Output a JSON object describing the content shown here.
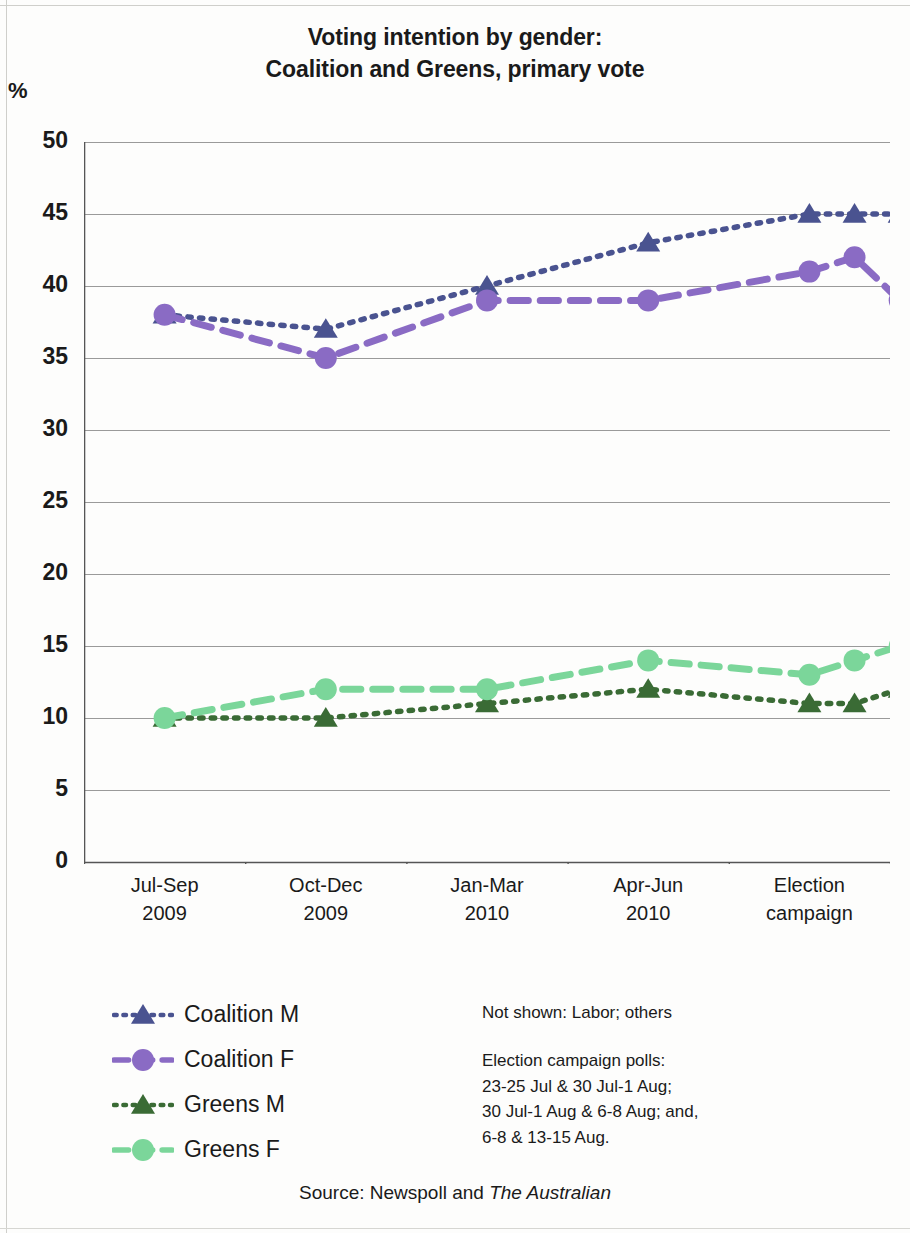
{
  "title": {
    "line1": "Voting intention by gender:",
    "line2": "Coalition and Greens, primary vote"
  },
  "axis_unit_label": "%",
  "legend": {
    "items": [
      {
        "label": "Coalition M",
        "color": "#4a5390",
        "marker": "triangle",
        "line": "dotted",
        "key_name": "legend-key-coalition-m"
      },
      {
        "label": "Coalition F",
        "color": "#8a6bc4",
        "marker": "circle",
        "line": "dashed",
        "key_name": "legend-key-coalition-f"
      },
      {
        "label": "Greens M",
        "color": "#3a6b35",
        "marker": "triangle",
        "line": "dotted",
        "key_name": "legend-key-greens-m"
      },
      {
        "label": "Greens F",
        "color": "#7bd69a",
        "marker": "circle",
        "line": "dashed",
        "key_name": "legend-key-greens-f"
      }
    ]
  },
  "notes": {
    "not_shown": "Not shown: Labor; others",
    "polls_heading": "Election campaign  polls:",
    "polls_line1": "23-25 Jul & 30 Jul-1 Aug;",
    "polls_line2": "30 Jul-1 Aug & 6-8 Aug; and,",
    "polls_line3": "6-8 & 13-15 Aug."
  },
  "source": {
    "prefix": "Source: Newspoll and ",
    "publication": "The Australian"
  },
  "chart_data": {
    "type": "line",
    "title": "Voting intention by gender: Coalition and Greens, primary vote",
    "subtitle": "",
    "xlabel": "",
    "ylabel": "%",
    "ylim": [
      0,
      50
    ],
    "ytick_step": 5,
    "yticks": [
      0,
      5,
      10,
      15,
      20,
      25,
      30,
      35,
      40,
      45,
      50
    ],
    "grid": true,
    "legend_position": "bottom-left",
    "categories": [
      {
        "line1": "Jul-Sep",
        "line2": "2009"
      },
      {
        "line1": "Oct-Dec",
        "line2": "2009"
      },
      {
        "line1": "Jan-Mar",
        "line2": "2010"
      },
      {
        "line1": "Apr-Jun",
        "line2": "2010"
      },
      {
        "line1": "Election",
        "line2": "campaign"
      }
    ],
    "x": [
      0,
      1,
      2,
      3,
      4,
      4.28,
      4.56
    ],
    "series": [
      {
        "name": "Coalition M",
        "color": "#4a5390",
        "marker": "triangle",
        "line": "dotted",
        "x": [
          0,
          1,
          2,
          3,
          4,
          4.28,
          4.56
        ],
        "values": [
          38,
          37,
          40,
          43,
          45,
          45,
          45
        ]
      },
      {
        "name": "Coalition F",
        "color": "#8a6bc4",
        "marker": "circle",
        "line": "dashed",
        "x": [
          0,
          1,
          2,
          3,
          4,
          4.28,
          4.56
        ],
        "values": [
          38,
          35,
          39,
          39,
          41,
          42,
          39
        ]
      },
      {
        "name": "Greens M",
        "color": "#3a6b35",
        "marker": "triangle",
        "line": "dotted",
        "x": [
          0,
          1,
          2,
          3,
          4,
          4.28,
          4.56
        ],
        "values": [
          10,
          10,
          11,
          12,
          11,
          11,
          12
        ]
      },
      {
        "name": "Greens F",
        "color": "#7bd69a",
        "marker": "circle",
        "line": "dashed",
        "x": [
          0,
          1,
          2,
          3,
          4,
          4.28,
          4.56
        ],
        "values": [
          10,
          12,
          12,
          14,
          13,
          14,
          15
        ]
      }
    ],
    "annotations": [
      "Not shown: Labor; others",
      "Election campaign  polls: 23-25 Jul & 30 Jul-1 Aug; 30 Jul-1 Aug & 6-8 Aug; and, 6-8 & 13-15 Aug."
    ]
  }
}
